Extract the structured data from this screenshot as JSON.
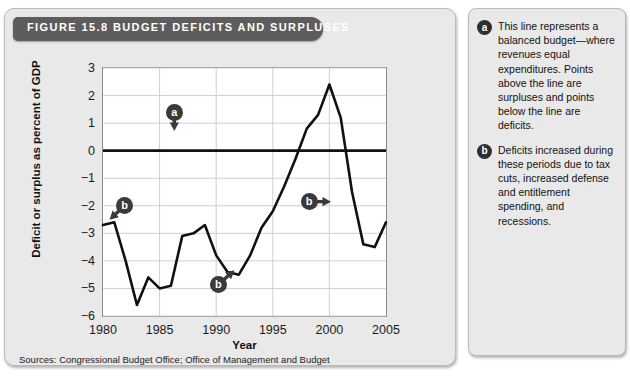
{
  "figure": {
    "label": "FIGURE 15.8",
    "title": "BUDGET DEFICITS AND SURPLUSES",
    "title_full": "FIGURE 15.8   BUDGET DEFICITS AND SURPLUSES",
    "sources": "Sources: Congressional Budget Office; Office of Management and Budget"
  },
  "notes": [
    {
      "marker": "a",
      "text": "This line represents a balanced budget—where revenues equal expenditures. Points above the line are surpluses and points below the line are deficits."
    },
    {
      "marker": "b",
      "text": "Deficits increased during these periods due to tax cuts, increased defense and entitlement spending, and recessions."
    }
  ],
  "callouts": [
    {
      "marker": "a",
      "arrow": "down",
      "x": 1986.3,
      "y": 1.4
    },
    {
      "marker": "b",
      "arrow": "down-left",
      "x": 1981.9,
      "y": -2.0
    },
    {
      "marker": "b",
      "arrow": "up-right",
      "x": 1990.2,
      "y": -4.85
    },
    {
      "marker": "b",
      "arrow": "right",
      "x": 1998.2,
      "y": -1.85
    }
  ],
  "chart_data": {
    "type": "line",
    "title": "BUDGET DEFICITS AND SURPLUSES",
    "xlabel": "Year",
    "ylabel": "Deficit or surplus as percent of GDP",
    "xlim": [
      1980,
      2005
    ],
    "ylim": [
      -6,
      3
    ],
    "xticks": [
      1980,
      1985,
      1990,
      1995,
      2000,
      2005
    ],
    "yticks": [
      3,
      2,
      1,
      0,
      -1,
      -2,
      -3,
      -4,
      -5,
      -6
    ],
    "ytick_labels": [
      "3",
      "2",
      "1",
      "0",
      "−1",
      "−2",
      "−3",
      "−4",
      "−5",
      "−6"
    ],
    "grid": true,
    "legend": null,
    "zero_line": 0,
    "series": [
      {
        "name": "Deficit or surplus as percent of GDP",
        "color": "#111111",
        "x": [
          1980,
          1981,
          1982,
          1983,
          1984,
          1985,
          1986,
          1987,
          1988,
          1989,
          1990,
          1991,
          1992,
          1993,
          1994,
          1995,
          1996,
          1997,
          1998,
          1999,
          2000,
          2001,
          2002,
          2003,
          2004,
          2005
        ],
        "values": [
          -2.7,
          -2.6,
          -4.0,
          -5.6,
          -4.6,
          -5.0,
          -4.9,
          -3.1,
          -3.0,
          -2.7,
          -3.8,
          -4.4,
          -4.5,
          -3.8,
          -2.8,
          -2.2,
          -1.3,
          -0.3,
          0.8,
          1.3,
          2.4,
          1.2,
          -1.5,
          -3.4,
          -3.5,
          -2.6
        ]
      }
    ]
  }
}
